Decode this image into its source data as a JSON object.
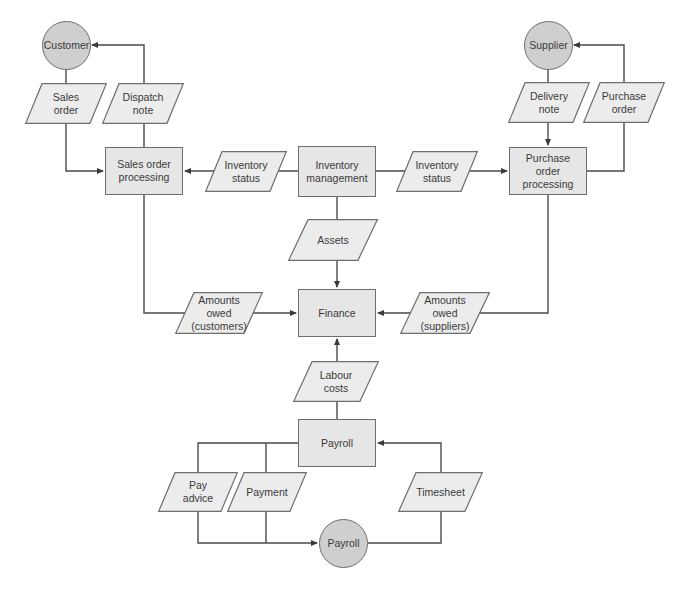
{
  "diagram": {
    "type": "data flow diagram",
    "colors": {
      "process_fill": "#e6e6e6",
      "entity_fill": "#cfcfcf",
      "data_fill": "#ececec",
      "stroke": "#4a4a4a",
      "text": "#3a3a3a"
    },
    "entities": {
      "customer": "Customer",
      "supplier": "Supplier",
      "payroll_entity": "Payroll"
    },
    "processes": {
      "sales_order_processing": "Sales order processing",
      "inventory_management": "Inventory management",
      "purchase_order_processing": "Purchase order processing",
      "finance": "Finance",
      "payroll": "Payroll"
    },
    "data_flows": {
      "sales_order": "Sales order",
      "dispatch_note": "Dispatch note",
      "delivery_note": "Delivery note",
      "purchase_order": "Purchase order",
      "inventory_status_left": "Inventory status",
      "inventory_status_right": "Inventory status",
      "assets": "Assets",
      "amounts_owed_customers": "Amounts owed (customers)",
      "amounts_owed_suppliers": "Amounts owed (suppliers)",
      "labour_costs": "Labour costs",
      "pay_advice": "Pay advice",
      "payment": "Payment",
      "timesheet": "Timesheet"
    },
    "edges": [
      {
        "from": "Customer",
        "to": "Sales order processing",
        "via": "Sales order"
      },
      {
        "from": "Sales order processing",
        "to": "Customer",
        "via": "Dispatch note"
      },
      {
        "from": "Inventory management",
        "to": "Sales order processing",
        "via": "Inventory status"
      },
      {
        "from": "Inventory management",
        "to": "Purchase order processing",
        "via": "Inventory status"
      },
      {
        "from": "Supplier",
        "to": "Purchase order processing",
        "via": "Delivery note"
      },
      {
        "from": "Purchase order processing",
        "to": "Supplier",
        "via": "Purchase order"
      },
      {
        "from": "Inventory management",
        "to": "Finance",
        "via": "Assets"
      },
      {
        "from": "Sales order processing",
        "to": "Finance",
        "via": "Amounts owed (customers)"
      },
      {
        "from": "Purchase order processing",
        "to": "Finance",
        "via": "Amounts owed (suppliers)"
      },
      {
        "from": "Payroll",
        "to": "Finance",
        "via": "Labour costs"
      },
      {
        "from": "Payroll",
        "to": "Payroll (entity)",
        "via": "Pay advice"
      },
      {
        "from": "Payroll",
        "to": "Payroll (entity)",
        "via": "Payment"
      },
      {
        "from": "Payroll (entity)",
        "to": "Payroll",
        "via": "Timesheet"
      }
    ]
  }
}
